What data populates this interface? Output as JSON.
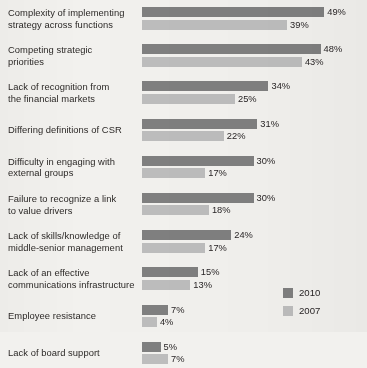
{
  "chart_data": {
    "type": "bar",
    "orientation": "horizontal",
    "title": "",
    "subtitle": "",
    "xlabel": "",
    "ylabel": "",
    "grid": false,
    "xlim": [
      0,
      50
    ],
    "value_suffix": "%",
    "legend_position": "bottom-right",
    "categories": [
      "Complexity of implementing strategy across functions",
      "Competing strategic priorities",
      "Lack of recognition from the financial markets",
      "Differing definitions of CSR",
      "Difficulty in engaging with external groups",
      "Failure to recognize a link to value drivers",
      "Lack of skills/knowledge of middle-senior management",
      "Lack of an effective communications infrastructure",
      "Employee resistance",
      "Lack of board support"
    ],
    "category_lines": [
      [
        "Complexity of implementing",
        "strategy across functions"
      ],
      [
        "Competing strategic",
        "priorities"
      ],
      [
        "Lack of recognition from",
        "the financial markets"
      ],
      [
        "Differing definitions of CSR",
        ""
      ],
      [
        "Difficulty in engaging with",
        "external groups"
      ],
      [
        "Failure to recognize a link",
        "to value drivers"
      ],
      [
        "Lack of skills/knowledge of",
        "middle-senior management"
      ],
      [
        "Lack of an effective",
        "communications infrastructure"
      ],
      [
        "Employee resistance",
        ""
      ],
      [
        "Lack of board support",
        ""
      ]
    ],
    "series": [
      {
        "name": "2010",
        "color": "#7f7f7f",
        "values": [
          49,
          48,
          34,
          31,
          30,
          30,
          24,
          15,
          7,
          5
        ],
        "value_labels": [
          "49%",
          "48%",
          "34%",
          "31%",
          "30%",
          "30%",
          "24%",
          "15%",
          "7%",
          "5%"
        ]
      },
      {
        "name": "2007",
        "color": "#bdbdbd",
        "values": [
          39,
          43,
          25,
          22,
          17,
          18,
          17,
          13,
          4,
          7
        ],
        "value_labels": [
          "39%",
          "43%",
          "25%",
          "22%",
          "17%",
          "18%",
          "17%",
          "13%",
          "4%",
          "7%"
        ]
      }
    ]
  },
  "legend": {
    "items": [
      {
        "label": "2010",
        "color": "#7f7f7f"
      },
      {
        "label": "2007",
        "color": "#bdbdbd"
      }
    ]
  }
}
